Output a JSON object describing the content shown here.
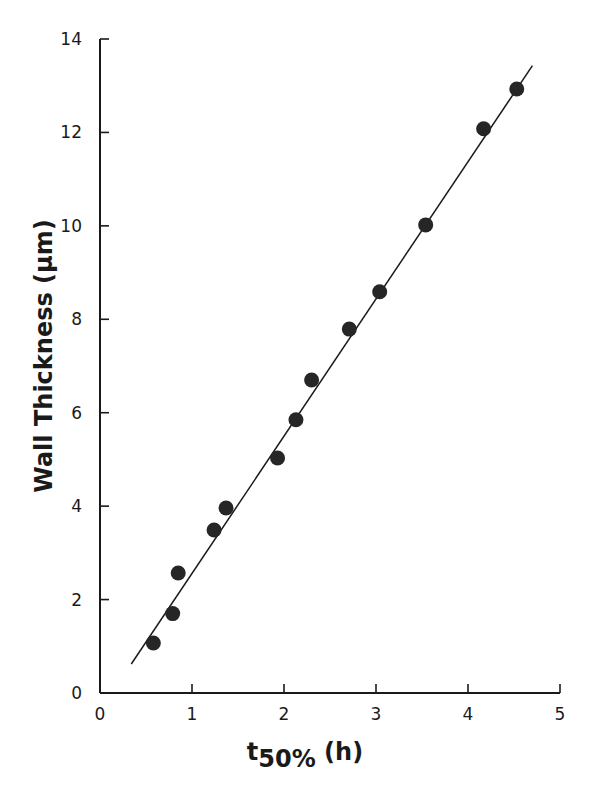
{
  "chart_data": {
    "type": "scatter",
    "title": "",
    "xlabel": "t50% (h)",
    "xlabel_parts": {
      "main": "t",
      "sub": "50%",
      "unit": " (h)"
    },
    "ylabel": "Wall Thickness (µm)",
    "xlim": [
      0,
      5
    ],
    "ylim": [
      0,
      14
    ],
    "xticks": [
      0,
      1,
      2,
      3,
      4,
      5
    ],
    "yticks": [
      0,
      2,
      4,
      6,
      8,
      10,
      12,
      14
    ],
    "grid": false,
    "legend": null,
    "series": [
      {
        "name": "measured",
        "marker": "filled-circle",
        "x": [
          0.58,
          0.79,
          0.85,
          1.24,
          1.37,
          1.93,
          2.13,
          2.3,
          2.71,
          3.04,
          3.54,
          4.17,
          4.53
        ],
        "y": [
          1.07,
          1.7,
          2.57,
          3.49,
          3.96,
          5.03,
          5.85,
          6.7,
          7.79,
          8.59,
          10.02,
          12.08,
          12.93
        ]
      },
      {
        "name": "linear fit",
        "marker": "line",
        "x": [
          0.34,
          4.7
        ],
        "y": [
          0.62,
          13.43
        ]
      }
    ]
  },
  "colors": {
    "ink": "#1a1a1a",
    "background": "#ffffff"
  }
}
